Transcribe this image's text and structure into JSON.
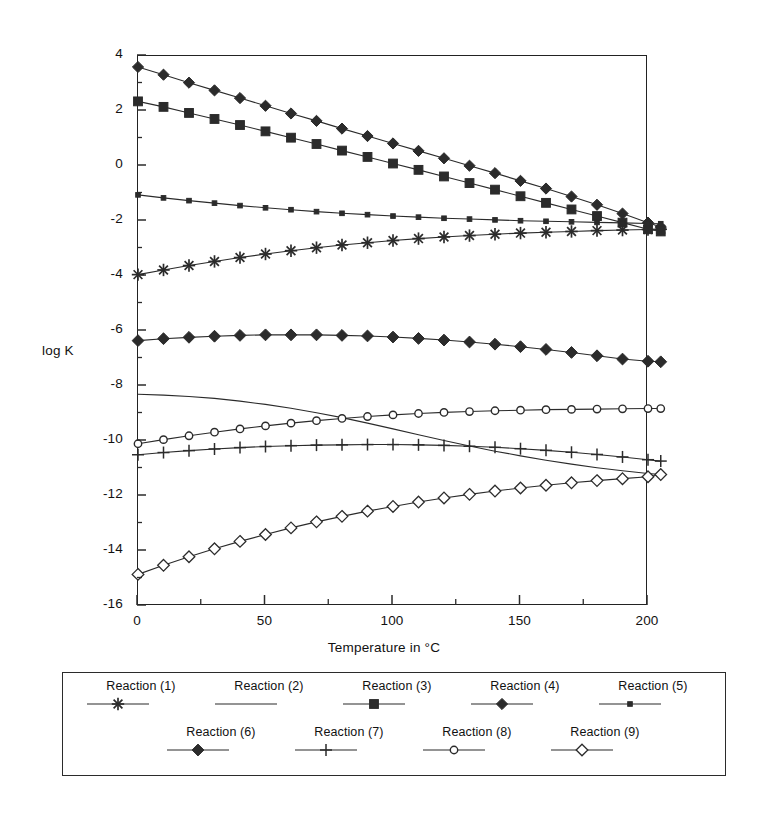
{
  "chart_data": {
    "type": "line",
    "title": "",
    "xlabel": "Temperature in °C",
    "ylabel": "log K",
    "xlim": [
      0,
      200
    ],
    "ylim": [
      -16,
      4
    ],
    "xticks": [
      0,
      50,
      100,
      150,
      200
    ],
    "xticklabels": [
      "0",
      "50",
      "100",
      "150",
      "200"
    ],
    "xminorticks": [
      25,
      75,
      125,
      175
    ],
    "yticks": [
      4,
      2,
      0,
      -2,
      -4,
      -6,
      -8,
      -10,
      -12,
      -14,
      -16
    ],
    "yticklabels": [
      "4",
      "2",
      "0",
      "-2",
      "-4",
      "-6",
      "-8",
      "-10",
      "-12",
      "-14",
      "-16"
    ],
    "yminorticks": [
      3,
      1,
      -1,
      -3,
      -5,
      -7,
      -9,
      -11,
      -13,
      -15
    ],
    "grid": false,
    "legend_position": "below-plot",
    "x": [
      0,
      10,
      20,
      30,
      40,
      50,
      60,
      70,
      80,
      90,
      100,
      110,
      120,
      130,
      140,
      150,
      160,
      170,
      180,
      190,
      200,
      205
    ],
    "series": [
      {
        "name": "Reaction (1)",
        "marker": "star",
        "values": [
          -3.95,
          -3.78,
          -3.62,
          -3.47,
          -3.33,
          -3.2,
          -3.08,
          -2.97,
          -2.87,
          -2.79,
          -2.71,
          -2.64,
          -2.58,
          -2.53,
          -2.48,
          -2.44,
          -2.41,
          -2.38,
          -2.35,
          -2.33,
          -2.31,
          -2.3
        ]
      },
      {
        "name": "Reaction (2)",
        "marker": "none",
        "values": [
          -8.3,
          -8.33,
          -8.38,
          -8.45,
          -8.55,
          -8.67,
          -8.81,
          -8.97,
          -9.15,
          -9.35,
          -9.56,
          -9.77,
          -9.98,
          -10.18,
          -10.37,
          -10.54,
          -10.7,
          -10.84,
          -10.97,
          -11.08,
          -11.18,
          -11.22
        ]
      },
      {
        "name": "Reaction (3)",
        "marker": "square-dot",
        "values": [
          2.35,
          2.15,
          1.93,
          1.71,
          1.49,
          1.26,
          1.03,
          0.8,
          0.56,
          0.33,
          0.09,
          -0.14,
          -0.38,
          -0.62,
          -0.86,
          -1.1,
          -1.34,
          -1.58,
          -1.82,
          -2.06,
          -2.3,
          -2.38
        ]
      },
      {
        "name": "Reaction (4)",
        "marker": "diamond-filled",
        "values": [
          3.6,
          3.32,
          3.03,
          2.75,
          2.47,
          2.19,
          1.91,
          1.64,
          1.36,
          1.09,
          0.82,
          0.55,
          0.28,
          0.01,
          -0.26,
          -0.54,
          -0.82,
          -1.11,
          -1.41,
          -1.73,
          -2.06,
          -2.22
        ]
      },
      {
        "name": "Reaction (5)",
        "marker": "square-small",
        "values": [
          -1.05,
          -1.16,
          -1.26,
          -1.35,
          -1.44,
          -1.52,
          -1.59,
          -1.66,
          -1.72,
          -1.77,
          -1.82,
          -1.86,
          -1.9,
          -1.93,
          -1.96,
          -1.99,
          -2.01,
          -2.03,
          -2.05,
          -2.07,
          -2.09,
          -2.1
        ]
      },
      {
        "name": "Reaction (6)",
        "marker": "diamond-large",
        "values": [
          -6.35,
          -6.28,
          -6.23,
          -6.19,
          -6.16,
          -6.14,
          -6.14,
          -6.14,
          -6.16,
          -6.18,
          -6.22,
          -6.27,
          -6.33,
          -6.4,
          -6.48,
          -6.57,
          -6.67,
          -6.78,
          -6.9,
          -7.02,
          -7.1,
          -7.12
        ]
      },
      {
        "name": "Reaction (7)",
        "marker": "plus",
        "values": [
          -10.5,
          -10.42,
          -10.35,
          -10.29,
          -10.24,
          -10.2,
          -10.17,
          -10.15,
          -10.14,
          -10.13,
          -10.13,
          -10.14,
          -10.16,
          -10.19,
          -10.23,
          -10.28,
          -10.34,
          -10.41,
          -10.49,
          -10.58,
          -10.68,
          -10.73
        ]
      },
      {
        "name": "Reaction (8)",
        "marker": "circle-open",
        "values": [
          -10.1,
          -9.95,
          -9.81,
          -9.68,
          -9.56,
          -9.45,
          -9.35,
          -9.26,
          -9.18,
          -9.11,
          -9.05,
          -9.0,
          -8.96,
          -8.93,
          -8.9,
          -8.88,
          -8.86,
          -8.85,
          -8.84,
          -8.83,
          -8.82,
          -8.82
        ]
      },
      {
        "name": "Reaction (9)",
        "marker": "diamond-open",
        "values": [
          -14.85,
          -14.52,
          -14.21,
          -13.92,
          -13.65,
          -13.4,
          -13.16,
          -12.94,
          -12.74,
          -12.55,
          -12.38,
          -12.22,
          -12.07,
          -11.94,
          -11.82,
          -11.71,
          -11.61,
          -11.52,
          -11.44,
          -11.37,
          -11.3,
          -11.22
        ]
      }
    ]
  },
  "legend": {
    "rows": [
      [
        {
          "label": "Reaction (1)",
          "marker": "star"
        },
        {
          "label": "Reaction (2)",
          "marker": "none"
        },
        {
          "label": "Reaction (3)",
          "marker": "square-dot"
        },
        {
          "label": "Reaction (4)",
          "marker": "diamond-filled"
        },
        {
          "label": "Reaction (5)",
          "marker": "square-small"
        }
      ],
      [
        {
          "label": "Reaction (6)",
          "marker": "diamond-large"
        },
        {
          "label": "Reaction (7)",
          "marker": "plus"
        },
        {
          "label": "Reaction (8)",
          "marker": "circle-open"
        },
        {
          "label": "Reaction (9)",
          "marker": "diamond-open"
        }
      ]
    ]
  },
  "colors": {
    "line": "#2b2b2b",
    "axis": "#222222",
    "text": "#111111",
    "background": "#ffffff"
  }
}
